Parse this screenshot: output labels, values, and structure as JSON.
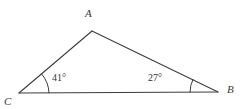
{
  "figure": {
    "kind": "triangle-geometry-diagram",
    "background_color": "#ffffff",
    "stroke_color": "#3d3d3d",
    "text_color": "#3a3a3a",
    "stroke_width": 1.1,
    "canvas": {
      "width": 248,
      "height": 109
    }
  },
  "vertices": {
    "a": {
      "label": "A",
      "x": 92,
      "y": 31,
      "label_x": 85,
      "label_y": 17
    },
    "b": {
      "label": "B",
      "x": 218,
      "y": 92,
      "label_x": 227,
      "label_y": 93
    },
    "c": {
      "label": "C",
      "x": 19,
      "y": 93,
      "label_x": 4,
      "label_y": 105
    }
  },
  "edges": [
    {
      "name": "edge-ca",
      "from": "C",
      "to": "A",
      "d": "M 19 93 L 92 31"
    },
    {
      "name": "edge-ab",
      "from": "A",
      "to": "B",
      "d": "M 92 31 L 218 92"
    },
    {
      "name": "edge-cb",
      "from": "C",
      "to": "B",
      "d": "M 19 93 L 218 92"
    }
  ],
  "angles": [
    {
      "name": "angle-at-c",
      "vertex": "C",
      "value": "41°",
      "measure_degrees": 41,
      "label_x": 52,
      "label_y": 81,
      "arc_d": "M 49 92.85 A 30 30 0 0 0 41.7 74.1"
    },
    {
      "name": "angle-at-b",
      "vertex": "B",
      "value": "27°",
      "measure_degrees": 27,
      "label_x": 148,
      "label_y": 81,
      "arc_d": "M 190 92.14 A 28 28 0 0 1 193.05 79.3"
    }
  ]
}
